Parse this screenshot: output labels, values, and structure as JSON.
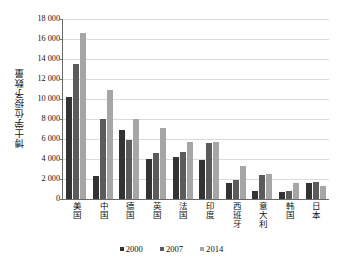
{
  "chart_data": {
    "type": "bar",
    "title": "",
    "xlabel": "",
    "ylabel": "博士学位授予数量",
    "ylim": [
      0,
      18000
    ],
    "ytick_step": 2000,
    "ytick_labels": [
      "18 000",
      "16 000",
      "14 000",
      "12 000",
      "10 000",
      "8 000",
      "6 000",
      "4 000",
      "2 000",
      "0"
    ],
    "ytick_values": [
      18000,
      16000,
      14000,
      12000,
      10000,
      8000,
      6000,
      4000,
      2000,
      0
    ],
    "grid": true,
    "legend_position": "bottom",
    "categories": [
      "美国",
      "中国",
      "德国",
      "英国",
      "法国",
      "印度",
      "西班牙",
      "意大利",
      "韩国",
      "日本"
    ],
    "series": [
      {
        "name": "2000",
        "color": "#333333",
        "values": [
          10200,
          2300,
          6950,
          3980,
          4250,
          3900,
          1620,
          800,
          700,
          1580
        ]
      },
      {
        "name": "2007",
        "color": "#5b5b5b",
        "values": [
          13550,
          8050,
          5950,
          4580,
          4720,
          5620,
          1930,
          2400,
          780,
          1680
        ]
      },
      {
        "name": "2014",
        "color": "#a6a6a6",
        "values": [
          16580,
          10880,
          8000,
          7150,
          5700,
          5720,
          3350,
          2500,
          1560,
          1330
        ]
      }
    ]
  },
  "legend": {
    "items": [
      {
        "label": "2000",
        "color": "#333333"
      },
      {
        "label": "2007",
        "color": "#5b5b5b"
      },
      {
        "label": "2014",
        "color": "#a6a6a6"
      }
    ]
  },
  "axis": {
    "line_color": "#6b6b6b",
    "grid_color": "#dcdcdc"
  }
}
